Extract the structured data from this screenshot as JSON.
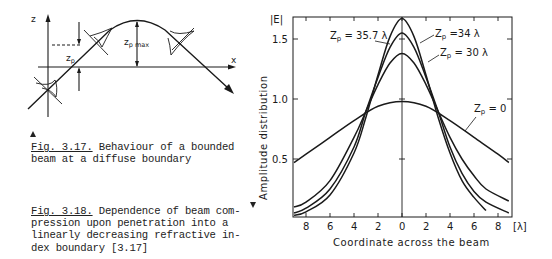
{
  "figure_317": {
    "caption_number": "Fig. 3.17.",
    "caption_line1": " Behaviour of a bounded",
    "caption_line2": "beam at a diffuse boundary",
    "labels": {
      "z_axis": "z",
      "x_axis": "x",
      "zp": "z",
      "zp_sub": "p",
      "zpmax": "z",
      "zpmax_sub": "p max"
    }
  },
  "figure_318": {
    "caption_number": "Fig. 3.18.",
    "caption_line1": " Dependence of beam com-",
    "caption_line2": "pression upon penetration into a",
    "caption_line3": "linearly decreasing refractive in-",
    "caption_line4": "dex boundary [3.17]"
  },
  "chart_data": {
    "type": "line",
    "title": "",
    "xlabel": "Coordinate across the beam",
    "xunit": "[λ]",
    "ylabel": "Amplitude distribution",
    "ylabel_top": "|E|",
    "x_ticks": [
      8,
      6,
      4,
      2,
      0,
      2,
      4,
      6,
      8
    ],
    "x_tick_positions": [
      -8,
      -6,
      -4,
      -2,
      0,
      2,
      4,
      6,
      8
    ],
    "y_ticks": [
      0.5,
      1.0,
      1.5
    ],
    "y_tick_labels": [
      "0.5",
      "1.0",
      "1.5"
    ],
    "xlim": [
      -9,
      9.1
    ],
    "ylim": [
      0.02,
      1.68
    ],
    "grid": false,
    "legend": "inline annotations",
    "series": [
      {
        "name": "Zp = 35.7 λ",
        "label_text": "Z",
        "label_sub": "p",
        "label_rest": " = 35.7 λ",
        "peak": 1.67,
        "x": [
          -9,
          -8,
          -6,
          -4,
          -3,
          -2,
          -1,
          0,
          1,
          2,
          3,
          4,
          5,
          6,
          7
        ],
        "values": [
          0.03,
          0.06,
          0.2,
          0.55,
          0.85,
          1.2,
          1.52,
          1.67,
          1.52,
          1.2,
          0.85,
          0.55,
          0.32,
          0.18,
          0.07
        ]
      },
      {
        "name": "Zp = 34 λ",
        "label_text": "Z",
        "label_sub": "p",
        "label_rest": " =34 λ",
        "peak": 1.55,
        "x": [
          -9,
          -8,
          -6,
          -4,
          -3,
          -2,
          -1,
          0,
          1,
          2,
          3,
          4,
          5,
          6,
          7,
          8.9
        ],
        "values": [
          0.05,
          0.09,
          0.25,
          0.6,
          0.9,
          1.18,
          1.43,
          1.55,
          1.43,
          1.18,
          0.9,
          0.6,
          0.38,
          0.23,
          0.14,
          0.05
        ]
      },
      {
        "name": "Zp = 30 λ",
        "label_text": "Z",
        "label_sub": "p",
        "label_rest": " = 30 λ",
        "peak": 1.38,
        "x": [
          -9,
          -8,
          -6,
          -4,
          -3,
          -2,
          -1,
          0,
          1,
          2,
          3,
          4,
          5,
          6,
          7,
          8.9
        ],
        "values": [
          0.1,
          0.14,
          0.32,
          0.68,
          0.9,
          1.12,
          1.3,
          1.38,
          1.3,
          1.12,
          0.9,
          0.68,
          0.5,
          0.36,
          0.25,
          0.15
        ]
      },
      {
        "name": "Zp = 0",
        "label_text": "Z",
        "label_sub": "p",
        "label_rest": " = 0",
        "peak": 0.98,
        "x": [
          -9,
          -8,
          -6,
          -4,
          -2,
          0,
          2,
          4,
          6,
          8,
          8.9
        ],
        "values": [
          0.47,
          0.54,
          0.68,
          0.82,
          0.94,
          0.98,
          0.94,
          0.82,
          0.68,
          0.54,
          0.47
        ]
      }
    ]
  }
}
